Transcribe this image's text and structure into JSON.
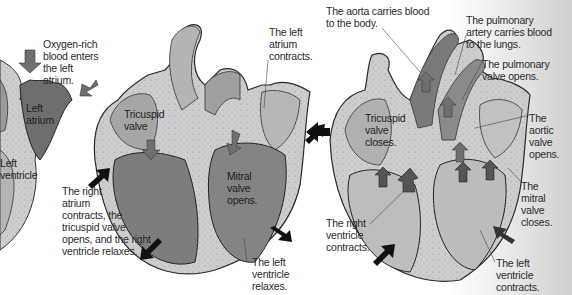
{
  "diagram": {
    "panels": [
      {
        "id": "left-atrium-filling",
        "labels": {
          "oxygen_rich": "Oxygen-rich\nblood enters\nthe left\natrium.",
          "left_atrium": "Left\natrium",
          "left_ventricle": "Left\nventricle"
        }
      },
      {
        "id": "atrial-systole",
        "labels": {
          "tricuspid_valve": "Tricuspid\nvalve",
          "left_atrium_contracts": "The left\natrium\ncontracts.",
          "mitral_valve_opens": "Mitral\nvalve\nopens.",
          "right_atrium_contracts": "The right\natrium\ncontracts, the\ntricuspid valve\nopens, and the right\nventricle relaxes.",
          "left_ventricle_relaxes": "The left\nventricle\nrelaxes."
        }
      },
      {
        "id": "ventricular-systole",
        "labels": {
          "aorta": "The aorta carries blood\nto the body.",
          "pulmonary_artery": "The pulmonary\nartery carries blood\nto the lungs.",
          "pulmonary_valve_opens": "The pulmonary\nvalve opens.",
          "aortic_valve_opens": "The\naortic\nvalve\nopens.",
          "tricuspid_closes": "Tricuspid\nvalve\ncloses.",
          "mitral_closes": "The\nmitral\nvalve\ncloses.",
          "right_ventricle_contracts": "The right\nventricle\ncontracts.",
          "left_ventricle_contracts": "The left\nventricle\ncontracts."
        }
      }
    ],
    "colors": {
      "wall": "#c9c9c9",
      "chamber_dark": "#777777",
      "chamber_mid": "#a8a8a8",
      "chamber_light": "#bdbdbd",
      "arrow_black": "#111111",
      "arrow_gray": "#6f6f6f",
      "text": "#2a2a2a"
    }
  }
}
